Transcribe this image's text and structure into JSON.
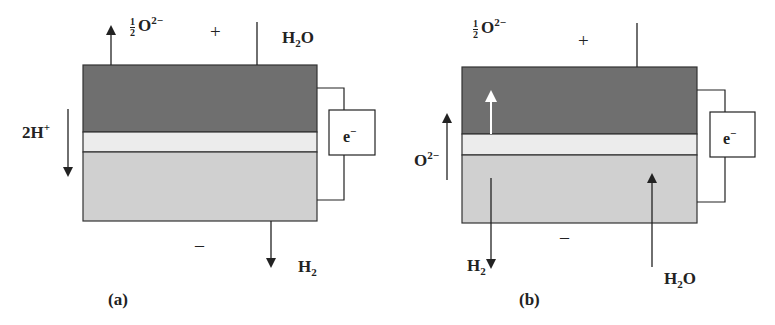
{
  "colors": {
    "anode_layer": "#6f6f6f",
    "electrolyte_layer": "#ececec",
    "cathode_layer": "#d0d0d0",
    "line": "#222222"
  },
  "panel_a": {
    "caption": "(a)",
    "top_half": "1",
    "top_den": "2",
    "top_species": "O",
    "top_charge": "2−",
    "plus_sign": "+",
    "top_product": "H",
    "top_product_sub": "2",
    "top_product_tail": "O",
    "side_ion": "2H",
    "side_ion_charge": "+",
    "circuit_label": "e",
    "circuit_charge": "−",
    "minus_sign": "–",
    "bottom_product": "H",
    "bottom_product_sub": "2"
  },
  "panel_b": {
    "caption": "(b)",
    "top_half": "1",
    "top_den": "2",
    "top_species": "O",
    "top_charge": "2−",
    "plus_sign": "+",
    "side_ion": "O",
    "side_ion_charge": "2−",
    "circuit_label": "e",
    "circuit_charge": "−",
    "minus_sign": "–",
    "bottom_left_product": "H",
    "bottom_left_product_sub": "2",
    "bottom_right_reactant": "H",
    "bottom_right_reactant_sub": "2",
    "bottom_right_reactant_tail": "O"
  }
}
